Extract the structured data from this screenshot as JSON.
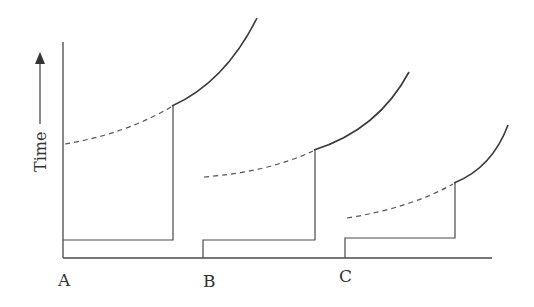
{
  "diagram": {
    "y_axis_label": "Time",
    "y_axis_arrow": "arrow-up",
    "points": [
      {
        "label": "A"
      },
      {
        "label": "B"
      },
      {
        "label": "C"
      }
    ],
    "colors": {
      "line": "#4a4a4a",
      "background": "#ffffff"
    },
    "segments": [
      {
        "point": "A",
        "low_box": "solid",
        "rise": "vertical line",
        "before_rise": "dashed curve",
        "after_rise": "solid curve"
      },
      {
        "point": "B",
        "low_box": "solid",
        "rise": "vertical line",
        "before_rise": "dashed curve",
        "after_rise": "solid curve"
      },
      {
        "point": "C",
        "low_box": "solid",
        "rise": "vertical line",
        "before_rise": "dashed curve",
        "after_rise": "solid curve"
      }
    ]
  }
}
